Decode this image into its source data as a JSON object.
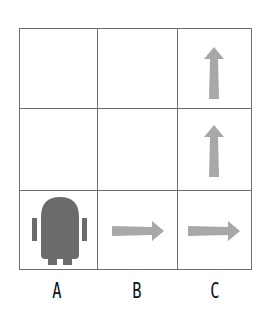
{
  "grid": {
    "rows": 3,
    "cols": 3,
    "cells": [
      {
        "row": 0,
        "col": "C",
        "content": "arrow-up"
      },
      {
        "row": 1,
        "col": "C",
        "content": "arrow-up"
      },
      {
        "row": 2,
        "col": "A",
        "content": "robot"
      },
      {
        "row": 2,
        "col": "B",
        "content": "arrow-right"
      },
      {
        "row": 2,
        "col": "C",
        "content": "arrow-right"
      }
    ]
  },
  "column_labels": [
    "A",
    "B",
    "C"
  ],
  "colors": {
    "arrow": "#a8a8a8",
    "robot": "#6b6b6b",
    "grid": "#6e6e6e"
  }
}
